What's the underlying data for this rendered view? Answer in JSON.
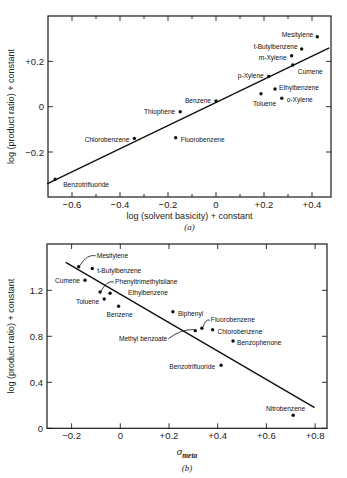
{
  "chart_data": [
    {
      "id": "a",
      "type": "scatter",
      "caption": "(a)",
      "xlabel": "log (solvent basicity) + constant",
      "ylabel": "log (product ratio) + constant",
      "xlim": [
        -0.7,
        0.48
      ],
      "ylim": [
        -0.39,
        0.4
      ],
      "xticks": [
        {
          "v": -0.6,
          "label": "−0.6"
        },
        {
          "v": -0.4,
          "label": "−0.4"
        },
        {
          "v": -0.2,
          "label": "−0.2"
        },
        {
          "v": 0,
          "label": "0"
        },
        {
          "v": 0.2,
          "label": "+0.2"
        },
        {
          "v": 0.4,
          "label": "+0.4"
        }
      ],
      "xminor": [
        -0.5,
        -0.3,
        -0.1,
        0.1,
        0.3
      ],
      "yticks": [
        {
          "v": 0.2,
          "label": "+0.2"
        },
        {
          "v": 0,
          "label": "0"
        },
        {
          "v": -0.2,
          "label": "−0.2"
        }
      ],
      "grid": false,
      "fit_line": {
        "x": [
          -0.704,
          0.472
        ],
        "y": [
          -0.341,
          0.26
        ]
      },
      "points": [
        {
          "name": "Mesitylene",
          "x": 0.422,
          "y": 0.309,
          "lx": -4,
          "ly": -2,
          "anchor": "end"
        },
        {
          "name": "t-Butylbenzene",
          "x": 0.357,
          "y": 0.255,
          "lx": -4,
          "ly": -2,
          "anchor": "end"
        },
        {
          "name": "m-Xylene",
          "x": 0.315,
          "y": 0.225,
          "lx": -5,
          "ly": 2,
          "anchor": "end"
        },
        {
          "name": "Cumene",
          "x": 0.32,
          "y": 0.184,
          "lx": 5,
          "ly": 7,
          "anchor": "start"
        },
        {
          "name": "p-Xylene",
          "x": 0.22,
          "y": 0.134,
          "lx": -5,
          "ly": 0,
          "anchor": "end"
        },
        {
          "name": "Ethylbenzene",
          "x": 0.246,
          "y": 0.078,
          "lx": 4,
          "ly": -1,
          "anchor": "start"
        },
        {
          "name": "Toluene",
          "x": 0.1875,
          "y": 0.057,
          "lx": -8,
          "ly": 10,
          "anchor": "start"
        },
        {
          "name": "o-Xylene",
          "x": 0.274,
          "y": 0.037,
          "lx": 5,
          "ly": 2,
          "anchor": "start"
        },
        {
          "name": "Benzene",
          "x": 0.0,
          "y": 0.025,
          "lx": -5,
          "ly": 0,
          "anchor": "end"
        },
        {
          "name": "Thiophene",
          "x": -0.149,
          "y": -0.022,
          "lx": -5,
          "ly": 0,
          "anchor": "end"
        },
        {
          "name": "Chlorobenzene",
          "x": -0.34,
          "y": -0.14,
          "lx": -5,
          "ly": 2,
          "anchor": "end"
        },
        {
          "name": "Fluorobenzene",
          "x": -0.168,
          "y": -0.137,
          "lx": 5,
          "ly": 2,
          "anchor": "start"
        },
        {
          "name": "Benzotrifluoride",
          "x": -0.67,
          "y": -0.32,
          "lx": 8,
          "ly": 6,
          "anchor": "start"
        }
      ]
    },
    {
      "id": "b",
      "type": "scatter",
      "caption": "(b)",
      "xlabel": "σmeta",
      "xlabel_main": "σ",
      "xlabel_sub": "meta",
      "ylabel": "log (product ratio) + constant",
      "xlim": [
        -0.3,
        0.85
      ],
      "ylim": [
        0,
        1.6
      ],
      "xticks": [
        {
          "v": -0.2,
          "label": "−0.2"
        },
        {
          "v": 0,
          "label": "0"
        },
        {
          "v": 0.2,
          "label": "+0.2"
        },
        {
          "v": 0.4,
          "label": "+0.4"
        },
        {
          "v": 0.6,
          "label": "+0.6"
        },
        {
          "v": 0.8,
          "label": "+0.8"
        }
      ],
      "xminor": [],
      "yticks": [
        {
          "v": 1.2,
          "label": "1.2"
        },
        {
          "v": 0.8,
          "label": "0.8"
        },
        {
          "v": 0.4,
          "label": "0.4"
        },
        {
          "v": 0,
          "label": "0"
        }
      ],
      "grid": false,
      "fit_line": {
        "x": [
          -0.224,
          0.798
        ],
        "y": [
          1.443,
          0.179
        ]
      },
      "points": [
        {
          "name": "Mesitylene",
          "x": -0.171,
          "y": 1.405,
          "lx": 18,
          "ly": -11,
          "anchor": "start",
          "leader": true
        },
        {
          "name": "t-Butylbenzene",
          "x": -0.115,
          "y": 1.39,
          "lx": 5,
          "ly": 3,
          "anchor": "start"
        },
        {
          "name": "Cumene",
          "x": -0.145,
          "y": 1.287,
          "lx": -5,
          "ly": 1,
          "anchor": "end"
        },
        {
          "name": "Phenyltrimethylsilane",
          "x": -0.083,
          "y": 1.185,
          "lx": 15,
          "ly": -10,
          "anchor": "start",
          "leader": true
        },
        {
          "name": "Ethylbenzene",
          "x": -0.042,
          "y": 1.174,
          "lx": 18,
          "ly": 0,
          "anchor": "start"
        },
        {
          "name": "Toluene",
          "x": -0.066,
          "y": 1.124,
          "lx": -5,
          "ly": 3,
          "anchor": "end"
        },
        {
          "name": "Benzene",
          "x": -0.007,
          "y": 1.061,
          "lx": -12,
          "ly": 9,
          "anchor": "start"
        },
        {
          "name": "Biphenyl",
          "x": 0.216,
          "y": 1.014,
          "lx": 5,
          "ly": 2,
          "anchor": "start"
        },
        {
          "name": "Fluorobenzene",
          "x": 0.335,
          "y": 0.87,
          "lx": 9,
          "ly": -8,
          "anchor": "start",
          "leader": true
        },
        {
          "name": "Chlorobenzene",
          "x": 0.379,
          "y": 0.857,
          "lx": 5,
          "ly": 2,
          "anchor": "start"
        },
        {
          "name": "Methyl benzoate",
          "x": 0.308,
          "y": 0.849,
          "lx": -28,
          "ly": 8,
          "anchor": "end",
          "leader": true
        },
        {
          "name": "Benzophenone",
          "x": 0.463,
          "y": 0.759,
          "lx": 4,
          "ly": 2,
          "anchor": "start"
        },
        {
          "name": "Benzotrifluoride",
          "x": 0.414,
          "y": 0.548,
          "lx": -6,
          "ly": 2,
          "anchor": "end"
        },
        {
          "name": "Nitrobenzene",
          "x": 0.71,
          "y": 0.113,
          "lx": 12,
          "ly": -6,
          "anchor": "end"
        }
      ]
    }
  ],
  "frames": [
    {
      "left": 48,
      "top": 16,
      "right": 331,
      "bottom": 197,
      "x0px": 216,
      "xscale": 240,
      "y0px": 106.7,
      "yscale": 226.5
    },
    {
      "left": 47,
      "top": 244,
      "right": 327,
      "bottom": 428.3,
      "x0px": 120.3,
      "xscale": 243.5,
      "y0px": 428.3,
      "yscale": 115
    }
  ]
}
